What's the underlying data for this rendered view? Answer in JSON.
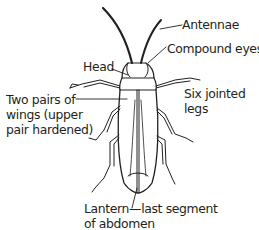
{
  "diagram": {
    "colors": {
      "ink": "#231f20",
      "background": "#ffffff"
    },
    "labels": {
      "antennae": "Antennae",
      "compound_eyes": "Compound eyes",
      "head": "Head",
      "wings_line1": "Two pairs of",
      "wings_line2": "wings (upper",
      "wings_line3": "pair hardened)",
      "legs_line1": "Six jointed",
      "legs_line2": "legs",
      "lantern_line1": "Lantern—last segment",
      "lantern_line2": "of abdomen"
    }
  }
}
